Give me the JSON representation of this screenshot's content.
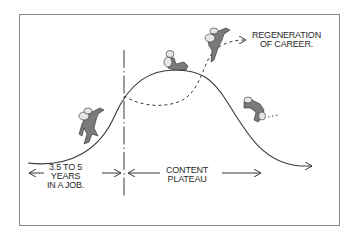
{
  "diagram": {
    "labels": {
      "regeneration": [
        "REGENERATION",
        "OF CAREER."
      ],
      "years": [
        "3.5 TO 5",
        "YEARS",
        "IN A JOB."
      ],
      "plateau": [
        "CONTENT",
        "PLATEAU"
      ]
    },
    "figures": [
      {
        "name": "climber-ascending",
        "pose": "climbing up slope"
      },
      {
        "name": "climber-resting",
        "pose": "sitting on peak"
      },
      {
        "name": "climber-leaping",
        "pose": "jumping up dashed path"
      },
      {
        "name": "climber-falling",
        "pose": "tumbling down slope"
      }
    ],
    "colors": {
      "line": "#3a3a3a",
      "figure_fill": "#7a7a7a",
      "figure_light": "#e6e6e6",
      "frame": "#8a8a8a"
    }
  }
}
